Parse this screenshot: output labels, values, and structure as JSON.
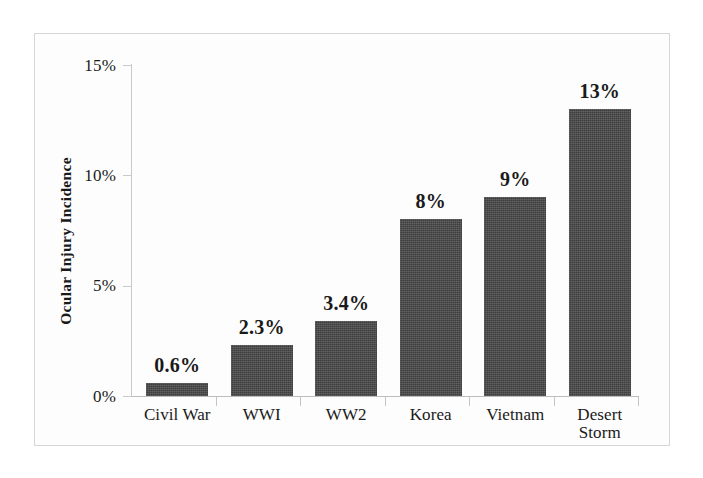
{
  "chart_data": {
    "type": "bar",
    "title": "",
    "subtitle": "",
    "xlabel": "",
    "ylabel": "Ocular Injury Incidence",
    "categories": [
      "Civil War",
      "WWI",
      "WW2",
      "Korea",
      "Vietnam",
      "Desert\nStorm"
    ],
    "values": [
      0.6,
      2.3,
      3.4,
      8,
      9,
      13
    ],
    "value_labels": [
      "0.6%",
      "2.3%",
      "3.4%",
      "8%",
      "9%",
      "13%"
    ],
    "ylim": [
      0,
      15
    ],
    "ytick_values": [
      0,
      5,
      10,
      15
    ],
    "ytick_labels": [
      "0%",
      "5%",
      "10%",
      "15%"
    ],
    "grid": false,
    "legend": "none",
    "bar_color": "#454545",
    "plot_background": "#fdfdfd",
    "axis_color": "#c9c9c9",
    "text_color": "#1a1a1a"
  }
}
